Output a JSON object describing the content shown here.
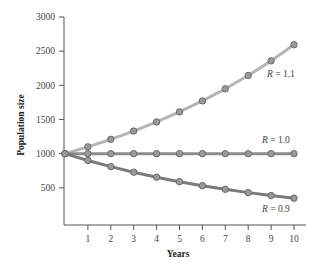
{
  "chart_data": {
    "type": "line",
    "title": "",
    "xlabel": "Years",
    "ylabel": "Population size",
    "x": [
      0,
      1,
      2,
      3,
      4,
      5,
      6,
      7,
      8,
      9,
      10
    ],
    "x_ticks": [
      1,
      2,
      3,
      4,
      5,
      6,
      7,
      8,
      9,
      10
    ],
    "y_ticks": [
      500,
      1000,
      1500,
      2000,
      2500,
      3000
    ],
    "xlim": [
      0,
      10.3
    ],
    "ylim": [
      0,
      3000
    ],
    "grid": false,
    "legend": "inline labels near line ends",
    "series": [
      {
        "name": "R = 1.1",
        "label_italic": "R",
        "label_rest": " = 1.1",
        "color": "#b4b4b4",
        "values": [
          1000,
          1100,
          1210,
          1331,
          1464,
          1611,
          1772,
          1949,
          2144,
          2358,
          2594
        ]
      },
      {
        "name": "R = 1.0",
        "label_italic": "R",
        "label_rest": " = 1.0",
        "color": "#8c8c8c",
        "values": [
          1000,
          1000,
          1000,
          1000,
          1000,
          1000,
          1000,
          1000,
          1000,
          1000,
          1000
        ]
      },
      {
        "name": "R = 0.9",
        "label_italic": "R",
        "label_rest": " = 0.9",
        "color": "#7a7a7a",
        "values": [
          1000,
          900,
          810,
          729,
          656,
          590,
          531,
          478,
          430,
          387,
          349
        ]
      }
    ]
  },
  "colors": {
    "axis": "#555555",
    "marker_fill": "#9a9a9a",
    "marker_stroke": "#6a6a6a"
  }
}
